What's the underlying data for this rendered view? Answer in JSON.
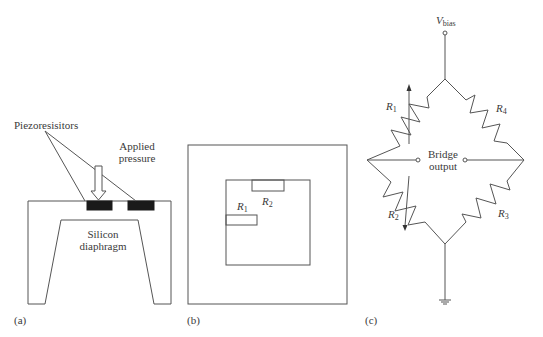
{
  "panels": {
    "a": {
      "tag": "(a)",
      "labels": {
        "piezoresistors": "Piezoresisitors",
        "applied_pressure_line1": "Applied",
        "applied_pressure_line2": "pressure",
        "diaphragm_line1": "Silicon",
        "diaphragm_line2": "diaphragm"
      }
    },
    "b": {
      "tag": "(b)",
      "labels": {
        "r1_main": "R",
        "r1_sub": "1",
        "r2_main": "R",
        "r2_sub": "2"
      }
    },
    "c": {
      "tag": "(c)",
      "labels": {
        "vbias_main": "V",
        "vbias_sub": "bias",
        "r1_main": "R",
        "r1_sub": "1",
        "r2_main": "R",
        "r2_sub": "2",
        "r3_main": "R",
        "r3_sub": "3",
        "r4_main": "R",
        "r4_sub": "4",
        "output_line1": "Bridge",
        "output_line2": "output"
      }
    }
  },
  "colors": {
    "line": "#555555",
    "resistor_fill": "#1a1a1a",
    "text": "#3a3a3a"
  }
}
